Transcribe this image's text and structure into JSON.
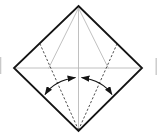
{
  "diagram": {
    "kind": "origami-fold-step",
    "canvas": {
      "width": 157,
      "height": 140,
      "background": "#ffffff"
    },
    "paper": {
      "shape": "square-rotated-45",
      "fill": "#ffffff",
      "outline_color": "#141414",
      "outline_width": 1.8,
      "vertices": [
        [
          78.5,
          6
        ],
        [
          142,
          68
        ],
        [
          78.5,
          131
        ],
        [
          14,
          68
        ]
      ]
    },
    "crease_styles": {
      "existing": {
        "color": "#b9b9b9",
        "width": 0.9,
        "dash": null
      },
      "valley": {
        "color": "#4d4d4d",
        "width": 1.0,
        "dash": "2.3 1.9"
      }
    },
    "creases": [
      {
        "name": "center-vertical-crease",
        "style": "existing",
        "x1": 78.5,
        "y1": 7.5,
        "x2": 78.5,
        "y2": 129.5
      },
      {
        "name": "center-horizontal-crease",
        "style": "existing",
        "x1": 15.5,
        "y1": 68,
        "x2": 140.5,
        "y2": 68
      },
      {
        "name": "upper-left-diagonal-crease",
        "style": "existing",
        "x1": 78.5,
        "y1": 8,
        "x2": 48.5,
        "y2": 68.5
      },
      {
        "name": "upper-right-diagonal-crease",
        "style": "existing",
        "x1": 78.5,
        "y1": 8,
        "x2": 108.5,
        "y2": 68.5
      },
      {
        "name": "left-valley-fold-line",
        "style": "valley",
        "x1": 78.5,
        "y1": 130,
        "x2": 40,
        "y2": 44
      },
      {
        "name": "right-valley-fold-line",
        "style": "valley",
        "x1": 78.5,
        "y1": 130,
        "x2": 117,
        "y2": 44
      }
    ],
    "arrows": {
      "color": "#141414",
      "width": 1.2,
      "items": [
        {
          "name": "fold-left-edge-to-center-arrow",
          "path": "M 45 94.5 Q 54.5 80.5 75.5 77.5",
          "double_headed": true
        },
        {
          "name": "fold-right-edge-to-center-arrow",
          "path": "M 112 94.5 Q 102.5 80.5 81.5 77.5",
          "double_headed": true
        }
      ]
    },
    "edge_artifacts": [
      {
        "name": "left-crop-artifact",
        "x1": 0.6,
        "y1": 57,
        "x2": 0.6,
        "y2": 74,
        "color": "#c9c9c9",
        "width": 1.4
      },
      {
        "name": "right-crop-artifact",
        "x1": 156.2,
        "y1": 58,
        "x2": 156.2,
        "y2": 75,
        "color": "#c9c9c9",
        "width": 1.4
      }
    ]
  }
}
